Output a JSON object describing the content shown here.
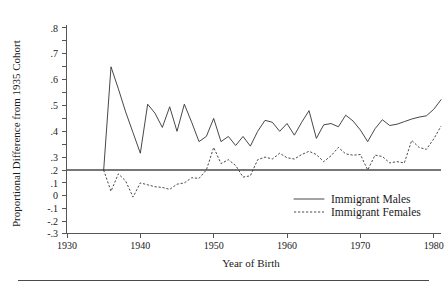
{
  "chart_data": {
    "type": "line",
    "title": "",
    "xlabel": "Year of Birth",
    "ylabel": "Proportional Difference from 1935 Cohort",
    "xlim": [
      1928,
      1982
    ],
    "ylim": [
      -0.3,
      0.8
    ],
    "grid": false,
    "legend_position": "bottom-right",
    "x_ticks": [
      1930,
      1940,
      1950,
      1960,
      1970,
      1980
    ],
    "x_tick_labels": [
      "1930",
      "1940",
      "1950",
      "1960",
      "1970",
      "1980"
    ],
    "y_ticks": [
      -0.3,
      -0.2,
      -0.1,
      0,
      0.1,
      0.2,
      0.3,
      0.4,
      0.5,
      0.6,
      0.7,
      0.8
    ],
    "y_tick_labels": [
      "-.3",
      "-.2",
      "-.1",
      "0",
      ".1",
      ".2",
      ".3",
      ".4",
      ".5",
      ".6",
      ".7",
      ".8"
    ],
    "zero_reference_line": 0,
    "x": [
      1935,
      1936,
      1937,
      1938,
      1939,
      1940,
      1941,
      1942,
      1943,
      1944,
      1945,
      1946,
      1947,
      1948,
      1949,
      1950,
      1951,
      1952,
      1953,
      1954,
      1955,
      1956,
      1957,
      1958,
      1959,
      1960,
      1961,
      1962,
      1963,
      1964,
      1965,
      1966,
      1967,
      1968,
      1969,
      1970,
      1971,
      1972,
      1973,
      1974,
      1975,
      1976,
      1977,
      1978,
      1979,
      1980,
      1981
    ],
    "series": [
      {
        "name": "Immigrant Males",
        "style": "solid",
        "values": [
          0.0,
          0.8,
          0.63,
          0.45,
          0.29,
          0.13,
          0.51,
          0.44,
          0.33,
          0.49,
          0.3,
          0.51,
          0.37,
          0.22,
          0.26,
          0.4,
          0.22,
          0.26,
          0.19,
          0.26,
          0.185,
          0.3,
          0.385,
          0.37,
          0.3,
          0.36,
          0.27,
          0.37,
          0.46,
          0.245,
          0.35,
          0.36,
          0.335,
          0.425,
          0.38,
          0.31,
          0.22,
          0.32,
          0.39,
          0.345,
          0.355,
          0.375,
          0.395,
          0.41,
          0.42,
          0.47,
          0.545
        ]
      },
      {
        "name": "Immigrant Females",
        "style": "dotted",
        "values": [
          0.0,
          -0.165,
          -0.03,
          -0.085,
          -0.21,
          -0.1,
          -0.115,
          -0.13,
          -0.135,
          -0.15,
          -0.11,
          -0.1,
          -0.06,
          -0.065,
          0.0,
          0.175,
          0.05,
          0.08,
          0.035,
          -0.055,
          -0.045,
          0.08,
          0.1,
          0.085,
          0.13,
          0.095,
          0.085,
          0.12,
          0.145,
          0.12,
          0.065,
          0.11,
          0.175,
          0.125,
          0.115,
          0.12,
          0.0,
          0.115,
          0.105,
          0.055,
          0.065,
          0.055,
          0.23,
          0.175,
          0.16,
          0.24,
          0.34
        ]
      }
    ]
  },
  "legend": {
    "items": [
      {
        "label": "Immigrant Males",
        "style": "solid"
      },
      {
        "label": "Immigrant Females",
        "style": "dotted"
      }
    ]
  },
  "axes": {
    "y_title": "Proportional Difference from 1935 Cohort",
    "x_title": "Year of Birth"
  },
  "colors": {
    "line": "#333333",
    "axis": "#555555",
    "zero": "#777777",
    "background": "#ffffff"
  }
}
